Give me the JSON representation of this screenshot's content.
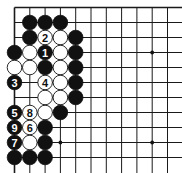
{
  "diagram": {
    "type": "go-board-fragment",
    "board_size": 19,
    "visible_cols": 11,
    "visible_rows": 11,
    "edges": {
      "top": true,
      "left": true,
      "right": false,
      "bottom": false
    },
    "colors": {
      "black": "#111111",
      "white": "#ffffff",
      "line": "#1a1a1a"
    },
    "star_points": [
      {
        "col": 9,
        "row": 3
      },
      {
        "col": 9,
        "row": 9
      },
      {
        "col": 3,
        "row": 9
      },
      {
        "col": 3,
        "row": 3
      }
    ],
    "stones": [
      {
        "col": 1,
        "row": 1,
        "color": "black",
        "label": ""
      },
      {
        "col": 2,
        "row": 1,
        "color": "black",
        "label": ""
      },
      {
        "col": 3,
        "row": 1,
        "color": "black",
        "label": ""
      },
      {
        "col": 1,
        "row": 2,
        "color": "black",
        "label": ""
      },
      {
        "col": 2,
        "row": 2,
        "color": "white",
        "label": "2"
      },
      {
        "col": 3,
        "row": 2,
        "color": "white",
        "label": ""
      },
      {
        "col": 4,
        "row": 2,
        "color": "black",
        "label": ""
      },
      {
        "col": 0,
        "row": 3,
        "color": "black",
        "label": ""
      },
      {
        "col": 1,
        "row": 3,
        "color": "white",
        "label": ""
      },
      {
        "col": 2,
        "row": 3,
        "color": "black",
        "label": "1"
      },
      {
        "col": 3,
        "row": 3,
        "color": "white",
        "label": ""
      },
      {
        "col": 4,
        "row": 3,
        "color": "black",
        "label": ""
      },
      {
        "col": 0,
        "row": 4,
        "color": "white",
        "label": ""
      },
      {
        "col": 1,
        "row": 4,
        "color": "white",
        "label": ""
      },
      {
        "col": 2,
        "row": 4,
        "color": "black",
        "label": ""
      },
      {
        "col": 3,
        "row": 4,
        "color": "white",
        "label": ""
      },
      {
        "col": 4,
        "row": 4,
        "color": "black",
        "label": ""
      },
      {
        "col": 0,
        "row": 5,
        "color": "black",
        "label": "3"
      },
      {
        "col": 2,
        "row": 5,
        "color": "white",
        "label": "4"
      },
      {
        "col": 3,
        "row": 5,
        "color": "white",
        "label": ""
      },
      {
        "col": 4,
        "row": 5,
        "color": "black",
        "label": ""
      },
      {
        "col": 2,
        "row": 6,
        "color": "white",
        "label": ""
      },
      {
        "col": 3,
        "row": 6,
        "color": "white",
        "label": ""
      },
      {
        "col": 4,
        "row": 6,
        "color": "black",
        "label": ""
      },
      {
        "col": 0,
        "row": 7,
        "color": "black",
        "label": "5"
      },
      {
        "col": 1,
        "row": 7,
        "color": "white",
        "label": "8"
      },
      {
        "col": 2,
        "row": 7,
        "color": "white",
        "label": ""
      },
      {
        "col": 3,
        "row": 7,
        "color": "black",
        "label": ""
      },
      {
        "col": 0,
        "row": 8,
        "color": "black",
        "label": "9"
      },
      {
        "col": 1,
        "row": 8,
        "color": "white",
        "label": "6"
      },
      {
        "col": 2,
        "row": 8,
        "color": "black",
        "label": ""
      },
      {
        "col": 0,
        "row": 9,
        "color": "black",
        "label": "7"
      },
      {
        "col": 1,
        "row": 9,
        "color": "white",
        "label": ""
      },
      {
        "col": 2,
        "row": 9,
        "color": "black",
        "label": ""
      },
      {
        "col": 0,
        "row": 10,
        "color": "black",
        "label": ""
      },
      {
        "col": 1,
        "row": 10,
        "color": "black",
        "label": ""
      },
      {
        "col": 2,
        "row": 10,
        "color": "black",
        "label": ""
      }
    ],
    "move_labels": [
      "1",
      "2",
      "3",
      "4",
      "5",
      "6",
      "7",
      "8",
      "9"
    ]
  }
}
